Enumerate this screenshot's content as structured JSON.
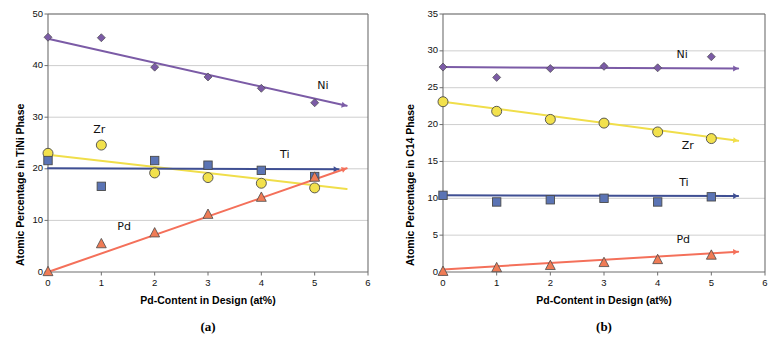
{
  "figure": {
    "background": "#ffffff",
    "width": 780,
    "height": 342
  },
  "panels": [
    {
      "caption": "(a)",
      "name": "panel-a"
    },
    {
      "caption": "(b)",
      "name": "panel-b"
    }
  ],
  "colors": {
    "ni": "#7B5BA6",
    "zr": "#F2E14C",
    "zr_line": "#F0DE4A",
    "ti": "#5B74B5",
    "ti_line": "#3F4F93",
    "pd": "#F07C56",
    "pd_line": "#F4705A",
    "axis": "#6E6E6E",
    "grid": "#B9B9B9",
    "marker_edge": "#4A4A4A",
    "text": "#101010"
  },
  "chart_data": [
    {
      "type": "scatter",
      "name": "tini-phase",
      "title": "",
      "xlabel": "Pd-Content in Design (at%)",
      "ylabel": "Atomic Percentage in TiNi Phase",
      "xlim": [
        0,
        6
      ],
      "ylim": [
        0,
        50
      ],
      "xticks": [
        "0",
        "1",
        "2",
        "3",
        "4",
        "5",
        "6"
      ],
      "xtick_values": [
        0,
        1,
        2,
        3,
        4,
        5,
        6
      ],
      "yticks": [
        "0",
        "10",
        "20",
        "30",
        "40",
        "50"
      ],
      "ytick_values": [
        0,
        10,
        20,
        30,
        40,
        50
      ],
      "grid": "horizontal",
      "legend": "inline-annotations",
      "x": [
        0,
        1,
        2,
        3,
        4,
        5
      ],
      "series": [
        {
          "name": "Ni",
          "label": "Ni",
          "marker": "diamond",
          "color": "#7B5BA6",
          "values": [
            45.5,
            45.4,
            39.7,
            37.8,
            35.6,
            32.8
          ],
          "trend": {
            "x0": 0,
            "y0": 45.2,
            "x1": 5.6,
            "y1": 32.2,
            "arrow": true
          },
          "label_pos": {
            "x": 5.05,
            "y": 35.8
          }
        },
        {
          "name": "Zr",
          "label": "Zr",
          "marker": "circle",
          "color": "#F2E14C",
          "values": [
            23.0,
            24.6,
            19.2,
            18.3,
            17.2,
            16.3
          ],
          "trend": {
            "x0": 0,
            "y0": 22.7,
            "x1": 5.6,
            "y1": 16.1,
            "arrow": false
          },
          "label_pos": {
            "x": 0.85,
            "y": 27.3
          }
        },
        {
          "name": "Ti",
          "label": "Ti",
          "marker": "square",
          "color": "#5B74B5",
          "values": [
            21.6,
            16.6,
            21.6,
            20.7,
            19.7,
            18.5
          ],
          "trend": {
            "x0": 0,
            "y0": 20.1,
            "x1": 5.45,
            "y1": 19.9,
            "arrow": true
          },
          "label_pos": {
            "x": 4.35,
            "y": 22.4
          }
        },
        {
          "name": "Pd",
          "label": "Pd",
          "marker": "triangle",
          "color": "#F07C56",
          "values": [
            0.1,
            5.5,
            7.6,
            11.2,
            14.5,
            18.4
          ],
          "trend": {
            "x0": 0,
            "y0": 0.0,
            "x1": 5.6,
            "y1": 20.1,
            "arrow": true
          },
          "label_pos": {
            "x": 1.3,
            "y": 8.6
          }
        }
      ]
    },
    {
      "type": "scatter",
      "name": "c14-phase",
      "title": "",
      "xlabel": "Pd-Content in Design (at%)",
      "ylabel": "Atomic Percentage in C14 Phase",
      "xlim": [
        0,
        6
      ],
      "ylim": [
        0,
        35
      ],
      "xticks": [
        "0",
        "1",
        "2",
        "3",
        "4",
        "5",
        "6"
      ],
      "xtick_values": [
        0,
        1,
        2,
        3,
        4,
        5,
        6
      ],
      "yticks": [
        "0",
        "5",
        "10",
        "15",
        "20",
        "25",
        "30",
        "35"
      ],
      "ytick_values": [
        0,
        5,
        10,
        15,
        20,
        25,
        30,
        35
      ],
      "grid": "horizontal",
      "legend": "inline-annotations",
      "x": [
        0,
        1,
        2,
        3,
        4,
        5
      ],
      "series": [
        {
          "name": "Ni",
          "label": "Ni",
          "marker": "diamond",
          "color": "#7B5BA6",
          "values": [
            27.8,
            26.4,
            27.6,
            27.9,
            27.7,
            29.2
          ],
          "trend": {
            "x0": 0,
            "y0": 27.8,
            "x1": 5.5,
            "y1": 27.6,
            "arrow": true
          },
          "label_pos": {
            "x": 4.35,
            "y": 29.3
          }
        },
        {
          "name": "Zr",
          "label": "Zr",
          "marker": "circle",
          "color": "#F2E14C",
          "values": [
            23.1,
            21.8,
            20.7,
            20.2,
            19.0,
            18.1
          ],
          "trend": {
            "x0": 0,
            "y0": 23.1,
            "x1": 5.5,
            "y1": 17.8,
            "arrow": true
          },
          "label_pos": {
            "x": 4.45,
            "y": 17.0
          }
        },
        {
          "name": "Ti",
          "label": "Ti",
          "marker": "square",
          "color": "#5B74B5",
          "values": [
            10.4,
            9.5,
            9.8,
            10.0,
            9.5,
            10.2
          ],
          "trend": {
            "x0": 0,
            "y0": 10.4,
            "x1": 5.5,
            "y1": 10.3,
            "arrow": true
          },
          "label_pos": {
            "x": 4.4,
            "y": 11.9
          }
        },
        {
          "name": "Pd",
          "label": "Pd",
          "marker": "triangle",
          "color": "#F07C56",
          "values": [
            0.1,
            0.6,
            0.9,
            1.3,
            1.7,
            2.3
          ],
          "trend": {
            "x0": 0,
            "y0": 0.35,
            "x1": 5.5,
            "y1": 2.75,
            "arrow": true
          },
          "label_pos": {
            "x": 4.35,
            "y": 4.2
          }
        }
      ]
    }
  ]
}
